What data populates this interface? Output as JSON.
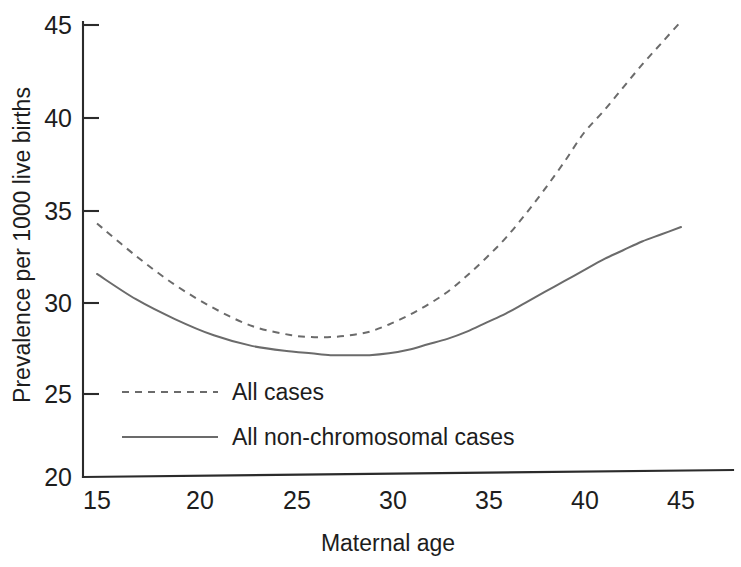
{
  "chart_data": {
    "type": "line",
    "title": "",
    "subtitle": "",
    "xlabel": "Maternal age",
    "ylabel": "Prevalence per 1000 live births",
    "xlim": [
      15,
      45
    ],
    "ylim": [
      20,
      45
    ],
    "xticks": [
      15,
      20,
      25,
      30,
      35,
      40,
      45
    ],
    "yticks": [
      20,
      25,
      30,
      35,
      40,
      45
    ],
    "xtick_labels": [
      "15",
      "20",
      "25",
      "30",
      "35",
      "40",
      "45"
    ],
    "ytick_labels": [
      "20",
      "25",
      "30",
      "35",
      "40",
      "45"
    ],
    "grid": false,
    "legend_position": "inside lower-left",
    "x": [
      15,
      17,
      19,
      21,
      23,
      25,
      26,
      27,
      28,
      29,
      30,
      31,
      32,
      33,
      34,
      35,
      36,
      37,
      38,
      39,
      40,
      41,
      42,
      43,
      44,
      45
    ],
    "series": [
      {
        "name": "All cases",
        "style": "dashed",
        "color": "#6b6b6b",
        "values": [
          34.0,
          32.2,
          30.6,
          29.3,
          28.3,
          27.8,
          27.7,
          27.7,
          27.8,
          28.0,
          28.4,
          28.9,
          29.5,
          30.2,
          31.1,
          32.1,
          33.2,
          34.5,
          35.9,
          37.4,
          39.0,
          40.2,
          41.5,
          42.8,
          44.0,
          45.2
        ]
      },
      {
        "name": "All non-chromosomal cases",
        "style": "solid",
        "color": "#6b6b6b",
        "values": [
          31.2,
          29.8,
          28.7,
          27.8,
          27.2,
          26.9,
          26.8,
          26.7,
          26.7,
          26.7,
          26.8,
          27.0,
          27.3,
          27.6,
          28.0,
          28.5,
          29.0,
          29.6,
          30.2,
          30.8,
          31.4,
          32.0,
          32.5,
          33.0,
          33.4,
          33.8
        ]
      }
    ]
  },
  "legend": {
    "items": [
      {
        "label": "All cases",
        "style": "dashed"
      },
      {
        "label": "All non-chromosomal cases",
        "style": "solid"
      }
    ]
  },
  "axes": {
    "x_title": "Maternal age",
    "y_title": "Prevalence per 1000 live births"
  }
}
